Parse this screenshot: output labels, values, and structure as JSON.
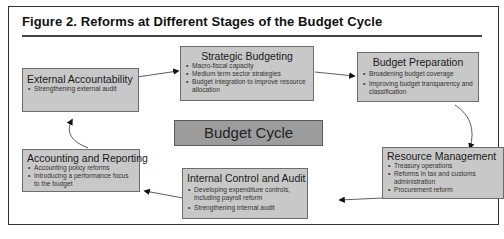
{
  "figure": {
    "title": "Figure 2. Reforms at Different Stages of the Budget Cycle",
    "center_label": "Budget Cycle"
  },
  "stages": [
    {
      "name": "Strategic Budgeting",
      "items": [
        "Macro-fiscal capacity",
        "Medium term sector strategies",
        "Budget integration to improve resource allocation"
      ]
    },
    {
      "name": "Budget Preparation",
      "items": [
        "Broadening budget coverage",
        "Improving budget transparency and classification"
      ]
    },
    {
      "name": "Resource Management",
      "items": [
        "Treasury operations",
        "Reforms in tax and customs administration",
        "Procurement reform"
      ]
    },
    {
      "name": "Internal Control and Audit",
      "items": [
        "Developing expenditure controls, including payroll reform",
        "Strengthening internal audit"
      ]
    },
    {
      "name": "Accounting and Reporting",
      "items": [
        "Accounting policy reforms",
        "Introducing a performance focus to the budget"
      ]
    },
    {
      "name": "External Accountability",
      "items": [
        "Strengthening external audit"
      ]
    }
  ],
  "colors": {
    "box_fill": "#c8c8c8",
    "center_fill": "#9c9c9c",
    "border": "#6d6d6d"
  }
}
